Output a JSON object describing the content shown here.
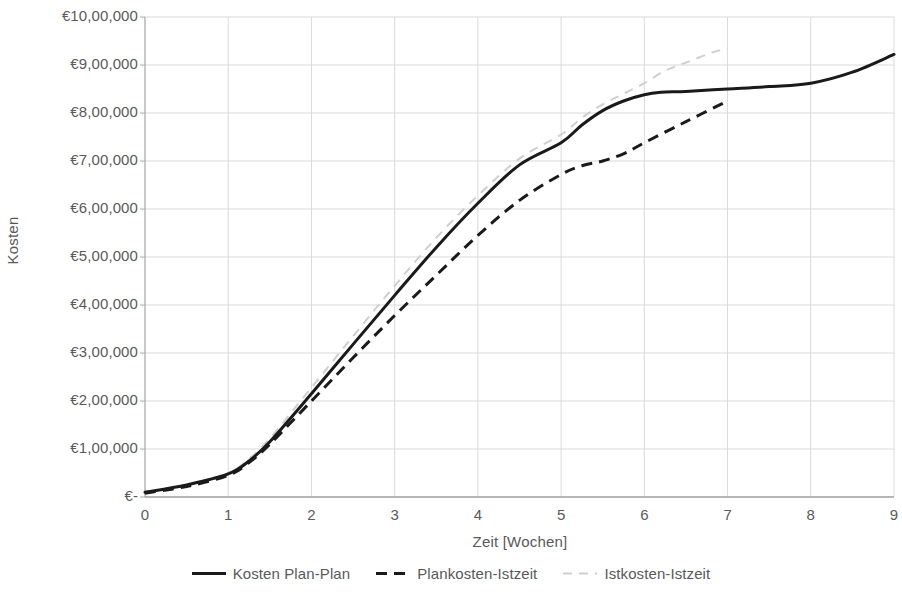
{
  "chart_data": {
    "type": "line",
    "title": "",
    "xlabel": "Zeit [Wochen]",
    "ylabel": "Kosten",
    "xlim": [
      0,
      9
    ],
    "ylim": [
      0,
      1000000
    ],
    "grid": true,
    "legend_position": "bottom",
    "x_tick_labels": [
      "0",
      "1",
      "2",
      "3",
      "4",
      "5",
      "6",
      "7",
      "8",
      "9"
    ],
    "x_ticks": [
      0,
      1,
      2,
      3,
      4,
      5,
      6,
      7,
      8,
      9
    ],
    "y_tick_labels": [
      "€-",
      "€1,00,000",
      "€2,00,000",
      "€3,00,000",
      "€4,00,000",
      "€5,00,000",
      "€6,00,000",
      "€7,00,000",
      "€8,00,000",
      "€9,00,000",
      "€10,00,000"
    ],
    "y_ticks": [
      0,
      100000,
      200000,
      300000,
      400000,
      500000,
      600000,
      700000,
      800000,
      900000,
      1000000
    ],
    "series": [
      {
        "name": "Kosten Plan-Plan",
        "style": "solid",
        "color": "#1a1a1a",
        "width": 3,
        "x": [
          0,
          0.5,
          1,
          1.25,
          1.5,
          2,
          2.5,
          3,
          3.5,
          4,
          4.5,
          5,
          5.25,
          5.5,
          5.75,
          6,
          6.2,
          6.5,
          7,
          7.5,
          8,
          8.5,
          9
        ],
        "y": [
          10000,
          25000,
          48000,
          75000,
          115000,
          215000,
          318000,
          420000,
          520000,
          612000,
          692000,
          738000,
          775000,
          805000,
          825000,
          838000,
          843000,
          845000,
          850000,
          855000,
          862000,
          885000,
          922000
        ]
      },
      {
        "name": "Plankosten-Istzeit",
        "style": "dashed",
        "color": "#1a1a1a",
        "width": 3,
        "x": [
          0,
          0.5,
          1,
          1.25,
          1.5,
          2,
          2.5,
          3,
          3.5,
          4,
          4.5,
          5,
          5.25,
          5.5,
          5.75,
          6,
          6.5,
          7
        ],
        "y": [
          8000,
          22000,
          45000,
          72000,
          110000,
          200000,
          290000,
          378000,
          462000,
          545000,
          618000,
          672000,
          690000,
          700000,
          715000,
          738000,
          782000,
          825000
        ]
      },
      {
        "name": "Istkosten-Istzeit",
        "style": "dashed-light",
        "color": "#cfcfcf",
        "width": 2,
        "x": [
          0,
          0.5,
          1,
          1.25,
          1.5,
          2,
          2.5,
          3,
          3.5,
          4,
          4.5,
          5,
          5.25,
          5.5,
          5.75,
          6,
          6.25,
          6.5,
          6.8,
          7
        ],
        "y": [
          10000,
          26000,
          50000,
          80000,
          122000,
          228000,
          335000,
          440000,
          540000,
          628000,
          705000,
          755000,
          790000,
          818000,
          840000,
          862000,
          888000,
          905000,
          925000,
          935000
        ]
      }
    ]
  },
  "axes": {
    "y_title": "Kosten",
    "x_title": "Zeit [Wochen]"
  },
  "legend": {
    "items": [
      {
        "label": "Kosten Plan-Plan",
        "style": "solid",
        "color": "#1a1a1a"
      },
      {
        "label": "Plankosten-Istzeit",
        "style": "dashed",
        "color": "#1a1a1a"
      },
      {
        "label": "Istkosten-Istzeit",
        "style": "dashed-light",
        "color": "#cfcfcf"
      }
    ]
  },
  "plot_geometry": {
    "left": 145,
    "right": 894,
    "top": 17,
    "bottom": 497
  }
}
